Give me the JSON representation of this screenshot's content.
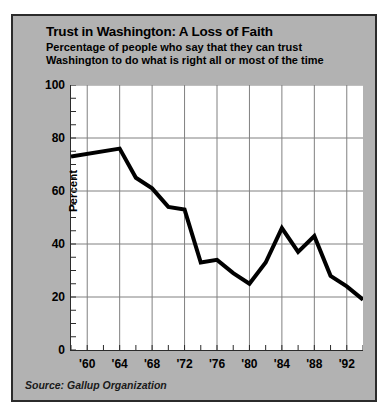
{
  "figure": {
    "background_color": "#b2b2b2",
    "border_color": "#2b2b2b",
    "plot_background_color": "#ffffff"
  },
  "title": "Trust in Washington: A Loss of Faith",
  "subtitle_line1": "Percentage of people who say that they can trust",
  "subtitle_line2": "Washington to do what is right all or most of the time",
  "source": "Source: Gallup Organization",
  "chart_data": {
    "type": "line",
    "title": "Trust in Washington: A Loss of Faith",
    "subtitle": "Percentage of people who say that they can trust Washington to do what is right all or most of the time",
    "xlabel": "",
    "ylabel": "Percent",
    "xlim": [
      1958,
      1994
    ],
    "ylim": [
      0,
      100
    ],
    "ytick_values": [
      0,
      20,
      40,
      60,
      80,
      100
    ],
    "ytick_labels": [
      "0",
      "20",
      "40",
      "60",
      "80",
      "100"
    ],
    "xtick_values": [
      1960,
      1964,
      1968,
      1972,
      1976,
      1980,
      1984,
      1988,
      1992
    ],
    "xtick_labels": [
      "'60",
      "'64",
      "'68",
      "'72",
      "'76",
      "'80",
      "'84",
      "'88",
      "'92"
    ],
    "minor_xtick_interval": 2,
    "grid": "both",
    "grid_color": "#808080",
    "legend": "none",
    "line_color": "#000000",
    "line_width": 4,
    "source": "Gallup Organization",
    "x": [
      1958,
      1964,
      1966,
      1968,
      1970,
      1972,
      1974,
      1976,
      1978,
      1980,
      1982,
      1984,
      1986,
      1988,
      1990,
      1992,
      1994
    ],
    "values": [
      73,
      76,
      65,
      61,
      54,
      53,
      33,
      34,
      29,
      25,
      33,
      46,
      37,
      43,
      28,
      24,
      19
    ],
    "series": [
      {
        "name": "Trust in Washington",
        "values": [
          73,
          76,
          65,
          61,
          54,
          53,
          33,
          34,
          29,
          25,
          33,
          46,
          37,
          43,
          28,
          24,
          19
        ]
      }
    ]
  }
}
